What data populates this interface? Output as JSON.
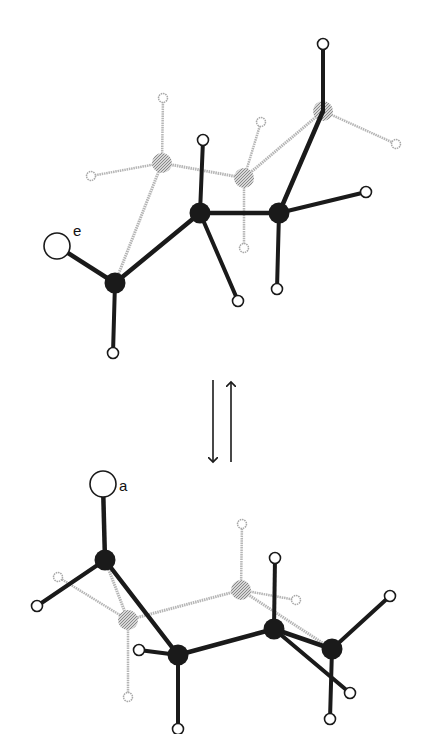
{
  "colors": {
    "front": "#1a1a1a",
    "back": "#a8a8a8",
    "back_bond": "#b5b5b5",
    "hydrogen_fill": "#ffffff",
    "background": "#ffffff"
  },
  "equilibrium_arrow": {
    "forward": {
      "x": 213,
      "y1": 380,
      "y2": 462
    },
    "reverse": {
      "x": 231,
      "y1": 462,
      "y2": 382
    }
  },
  "conformers": [
    {
      "name": "equatorial-conformer",
      "label": "e",
      "label_pos": [
        73,
        236
      ],
      "substituent": {
        "pos": [
          57,
          246
        ],
        "r": 13,
        "attached_to": 0
      },
      "carbons": [
        {
          "pos": [
            115,
            283
          ],
          "layer": "front"
        },
        {
          "pos": [
            200,
            213
          ],
          "layer": "front"
        },
        {
          "pos": [
            279,
            213
          ],
          "layer": "front"
        },
        {
          "pos": [
            323,
            111
          ],
          "layer": "back"
        },
        {
          "pos": [
            244,
            178
          ],
          "layer": "back"
        },
        {
          "pos": [
            162,
            163
          ],
          "layer": "back"
        }
      ],
      "ring_bonds": [
        [
          0,
          1,
          "front"
        ],
        [
          1,
          2,
          "front"
        ],
        [
          2,
          3,
          "front"
        ],
        [
          3,
          4,
          "back"
        ],
        [
          4,
          5,
          "back"
        ],
        [
          5,
          0,
          "back"
        ]
      ],
      "hydrogens": [
        {
          "pos": [
            113,
            353
          ],
          "on": 0,
          "layer": "front"
        },
        {
          "pos": [
            203,
            140
          ],
          "on": 1,
          "layer": "front"
        },
        {
          "pos": [
            238,
            301
          ],
          "on": 1,
          "layer": "front"
        },
        {
          "pos": [
            366,
            192
          ],
          "on": 2,
          "layer": "front"
        },
        {
          "pos": [
            277,
            289
          ],
          "on": 2,
          "layer": "front"
        },
        {
          "pos": [
            323,
            44
          ],
          "on": 3,
          "layer": "front"
        },
        {
          "pos": [
            396,
            144
          ],
          "on": 3,
          "layer": "back"
        },
        {
          "pos": [
            261,
            122
          ],
          "on": 4,
          "layer": "back"
        },
        {
          "pos": [
            244,
            248
          ],
          "on": 4,
          "layer": "back"
        },
        {
          "pos": [
            163,
            98
          ],
          "on": 5,
          "layer": "back"
        },
        {
          "pos": [
            91,
            176
          ],
          "on": 5,
          "layer": "back"
        }
      ]
    },
    {
      "name": "axial-conformer",
      "label": "a",
      "label_pos": [
        119,
        491
      ],
      "substituent": {
        "pos": [
          103,
          484
        ],
        "r": 13,
        "attached_to": 0
      },
      "carbons": [
        {
          "pos": [
            105,
            560
          ],
          "layer": "front"
        },
        {
          "pos": [
            178,
            655
          ],
          "layer": "front"
        },
        {
          "pos": [
            274,
            629
          ],
          "layer": "front"
        },
        {
          "pos": [
            332,
            649
          ],
          "layer": "front"
        },
        {
          "pos": [
            241,
            590
          ],
          "layer": "back"
        },
        {
          "pos": [
            128,
            620
          ],
          "layer": "back"
        }
      ],
      "ring_bonds": [
        [
          0,
          1,
          "front"
        ],
        [
          1,
          2,
          "front"
        ],
        [
          2,
          3,
          "front"
        ],
        [
          3,
          4,
          "back"
        ],
        [
          4,
          5,
          "back"
        ],
        [
          5,
          0,
          "back"
        ]
      ],
      "hydrogens": [
        {
          "pos": [
            37,
            606
          ],
          "on": 0,
          "layer": "front"
        },
        {
          "pos": [
            139,
            650
          ],
          "on": 1,
          "layer": "front"
        },
        {
          "pos": [
            178,
            729
          ],
          "on": 1,
          "layer": "front"
        },
        {
          "pos": [
            275,
            558
          ],
          "on": 2,
          "layer": "front"
        },
        {
          "pos": [
            350,
            693
          ],
          "on": 2,
          "layer": "front"
        },
        {
          "pos": [
            390,
            596
          ],
          "on": 3,
          "layer": "back"
        },
        {
          "pos": [
            330,
            719
          ],
          "on": 3,
          "layer": "back"
        },
        {
          "pos": [
            242,
            524
          ],
          "on": 4,
          "layer": "back"
        },
        {
          "pos": [
            296,
            600
          ],
          "on": 4,
          "layer": "back"
        },
        {
          "pos": [
            58,
            577
          ],
          "on": 5,
          "layer": "back"
        },
        {
          "pos": [
            128,
            697
          ],
          "on": 5,
          "layer": "back"
        }
      ]
    }
  ]
}
